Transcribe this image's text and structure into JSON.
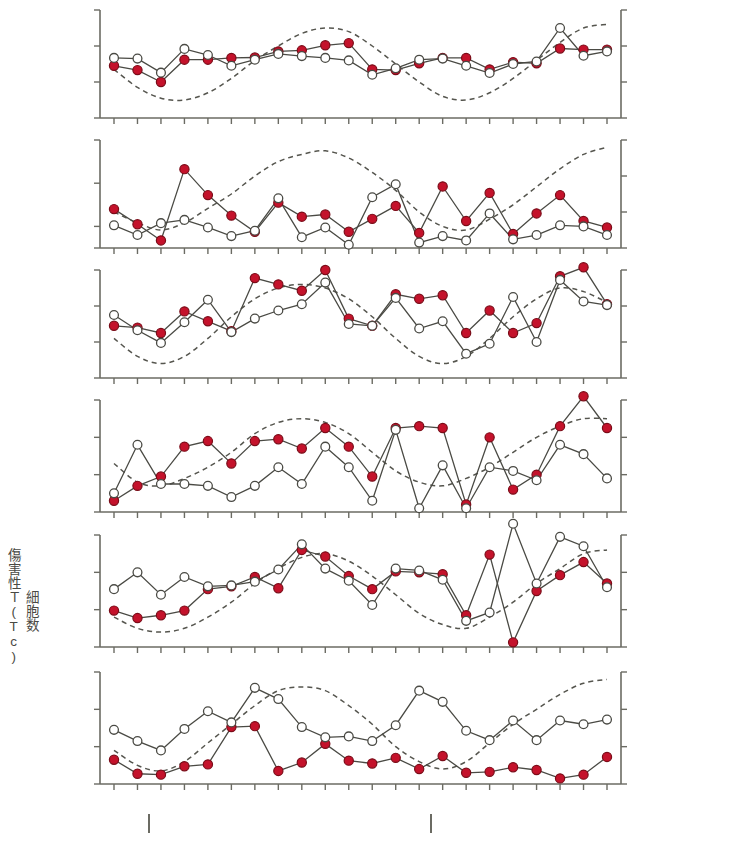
{
  "figure": {
    "right_axis_label": "気温",
    "degf_label": "°F",
    "right_ticks": [
      "90",
      "70",
      "50",
      "30"
    ],
    "x_months": [
      "11",
      "12",
      "1",
      "2",
      "3",
      "4",
      "5",
      "6",
      "7",
      "8",
      "9",
      "10",
      "11",
      "12",
      "1",
      "2",
      "3",
      "4",
      "5",
      "6",
      "7",
      "8"
    ],
    "years": [
      {
        "label": "1981",
        "center_index": 0.5
      },
      {
        "label": "1982",
        "center_index": 7.5
      },
      {
        "label": "1983",
        "center_index": 18.0
      }
    ],
    "year_separator_indices": [
      1.5,
      13.5
    ],
    "colors": {
      "marker_red": "#c4122b",
      "marker_open": "#ffffff",
      "line": "#4a4a44",
      "dashed": "#55554e",
      "axis": "#6b6b63"
    }
  },
  "chart_data": [
    {
      "type": "line",
      "panel": "a",
      "title": "リンパ球数",
      "unit": "(×10⁵/ mℓ)",
      "unit_exp": "6",
      "ylabel_ticks": [
        "3",
        "2",
        "1",
        "0"
      ],
      "ylim": [
        0,
        3
      ],
      "ytick_values": [
        3,
        2,
        1,
        0
      ],
      "right_ylim": [
        30,
        90
      ],
      "x": [
        "11",
        "12",
        "1",
        "2",
        "3",
        "4",
        "5",
        "6",
        "7",
        "8",
        "9",
        "10",
        "11",
        "12",
        "1",
        "2",
        "3",
        "4",
        "5",
        "6",
        "7",
        "8"
      ],
      "series": [
        {
          "name": "closed-red",
          "values": [
            1.45,
            1.33,
            1.0,
            1.62,
            1.62,
            1.67,
            1.68,
            1.85,
            1.88,
            2.02,
            2.08,
            1.35,
            1.33,
            1.52,
            1.67,
            1.67,
            1.35,
            1.55,
            1.52,
            1.93,
            1.9,
            1.9
          ]
        },
        {
          "name": "open-white",
          "values": [
            1.67,
            1.65,
            1.26,
            1.92,
            1.75,
            1.45,
            1.62,
            1.78,
            1.72,
            1.67,
            1.6,
            1.2,
            1.38,
            1.62,
            1.65,
            1.45,
            1.25,
            1.5,
            1.57,
            2.5,
            1.73,
            1.85
          ]
        }
      ],
      "dashed_curve": {
        "name": "temperature",
        "values_f": [
          57,
          47,
          41,
          40,
          44,
          52,
          62,
          70,
          77,
          80,
          78,
          70,
          60,
          50,
          42,
          40,
          44,
          52,
          62,
          72,
          80,
          82
        ]
      }
    },
    {
      "type": "line",
      "panel": "b",
      "title": "単球数",
      "unit": "(×10⁵/ mℓ)",
      "unit_exp": "5",
      "ylabel_ticks": [
        "6",
        "4",
        "2",
        "1"
      ],
      "ylim": [
        1,
        6
      ],
      "ytick_values": [
        6,
        4,
        2,
        1
      ],
      "right_ylim": [
        30,
        90
      ],
      "x": [
        "11",
        "12",
        "1",
        "2",
        "3",
        "4",
        "5",
        "6",
        "7",
        "8",
        "9",
        "10",
        "11",
        "12",
        "1",
        "2",
        "3",
        "4",
        "5",
        "6",
        "7",
        "8"
      ],
      "series": [
        {
          "name": "closed-red",
          "values": [
            2.8,
            2.1,
            1.35,
            4.65,
            3.45,
            2.5,
            1.75,
            3.1,
            2.45,
            2.55,
            1.75,
            2.35,
            2.95,
            1.7,
            3.85,
            2.25,
            3.55,
            1.65,
            2.6,
            3.45,
            2.25,
            1.95
          ]
        },
        {
          "name": "open-white",
          "values": [
            2.05,
            1.6,
            2.15,
            2.3,
            1.95,
            1.55,
            1.8,
            3.3,
            1.5,
            1.95,
            1.15,
            3.35,
            3.95,
            1.25,
            1.55,
            1.35,
            2.6,
            1.4,
            1.6,
            2.05,
            2.0,
            1.6
          ]
        }
      ],
      "dashed_curve": {
        "name": "temperature",
        "values_f": [
          50,
          44,
          40,
          44,
          52,
          60,
          70,
          78,
          82,
          84,
          80,
          72,
          62,
          50,
          42,
          40,
          46,
          54,
          64,
          74,
          82,
          86
        ]
      }
    },
    {
      "type": "line",
      "panel": "c",
      "title": "全Ｔ細胞数",
      "unit": "(×10⁵/ mℓ)",
      "unit_exp": "5",
      "ylabel_ticks": [
        "14",
        "10",
        "6",
        "2"
      ],
      "ylim": [
        2,
        14
      ],
      "ytick_values": [
        14,
        10,
        6,
        2
      ],
      "right_ylim": [
        30,
        90
      ],
      "x": [
        "11",
        "12",
        "1",
        "2",
        "3",
        "4",
        "5",
        "6",
        "7",
        "8",
        "9",
        "10",
        "11",
        "12",
        "1",
        "2",
        "3",
        "4",
        "5",
        "6",
        "7",
        "8"
      ],
      "series": [
        {
          "name": "closed-red",
          "values": [
            7.8,
            7.6,
            7.0,
            9.4,
            8.3,
            7.2,
            13.1,
            12.4,
            11.7,
            14.0,
            8.6,
            7.8,
            11.3,
            10.8,
            11.2,
            7.0,
            9.5,
            7.0,
            8.1,
            13.3,
            14.3,
            10.2
          ]
        },
        {
          "name": "open-white",
          "values": [
            9.0,
            7.3,
            5.9,
            8.2,
            10.7,
            7.1,
            8.6,
            9.5,
            10.2,
            12.6,
            8.0,
            7.8,
            10.9,
            7.5,
            8.3,
            4.7,
            5.8,
            11.0,
            6.0,
            12.9,
            10.5,
            10.1
          ]
        },
        {
          "name": "dashed-temp",
          "values": [
            6.0,
            4.4,
            3.8,
            4.6,
            6.4,
            8.6,
            10.5,
            11.6,
            11.8,
            11.5,
            10.2,
            8.2,
            6.2,
            4.6,
            4.0,
            4.6,
            6.4,
            8.6,
            10.4,
            11.5,
            11.0,
            10.0
          ]
        }
      ],
      "dashed_curve": {
        "name": "temperature",
        "values_f": [
          52,
          42,
          38,
          42,
          52,
          64,
          74,
          80,
          82,
          80,
          74,
          64,
          52,
          42,
          38,
          42,
          52,
          64,
          74,
          80,
          78,
          72
        ]
      }
    },
    {
      "type": "line",
      "panel": "d",
      "title": "ヘルパーＴ(Th)細胞数",
      "unit": "(×10⁵/ mℓ)",
      "unit_exp": "5",
      "ylabel_ticks": [
        "9",
        "7",
        "5",
        "3"
      ],
      "ylim": [
        3,
        9
      ],
      "ytick_values": [
        9,
        7,
        5,
        3
      ],
      "right_ylim": [
        30,
        90
      ],
      "x": [
        "11",
        "12",
        "1",
        "2",
        "3",
        "4",
        "5",
        "6",
        "7",
        "8",
        "9",
        "10",
        "11",
        "12",
        "1",
        "2",
        "3",
        "4",
        "5",
        "6",
        "7",
        "8"
      ],
      "series": [
        {
          "name": "closed-red",
          "values": [
            3.6,
            4.4,
            4.9,
            6.5,
            6.8,
            5.6,
            6.8,
            6.9,
            6.4,
            7.5,
            6.5,
            4.9,
            7.5,
            7.6,
            7.5,
            3.4,
            7.0,
            4.2,
            5.0,
            7.6,
            9.2,
            7.5
          ]
        },
        {
          "name": "open-white",
          "values": [
            4.0,
            6.6,
            4.5,
            4.5,
            4.4,
            3.8,
            4.4,
            5.4,
            4.5,
            6.5,
            5.4,
            3.6,
            7.4,
            3.2,
            5.5,
            3.2,
            5.4,
            5.2,
            4.7,
            6.6,
            6.1,
            4.8
          ]
        }
      ],
      "dashed_curve": {
        "name": "temperature",
        "values_f": [
          56,
          46,
          44,
          48,
          54,
          62,
          72,
          78,
          80,
          78,
          72,
          62,
          52,
          46,
          44,
          48,
          54,
          62,
          70,
          76,
          80,
          80
        ]
      }
    },
    {
      "type": "line",
      "panel": "e",
      "title": "傷害性Ｔ(Tc)\n細胞数",
      "unit": "(×10⁵/ mℓ)",
      "unit_exp": "5",
      "ylabel_ticks": [
        "7",
        "5",
        "3",
        "1"
      ],
      "ylim": [
        1,
        7
      ],
      "ytick_values": [
        7,
        5,
        3,
        1
      ],
      "right_ylim": [
        30,
        90
      ],
      "x": [
        "11",
        "12",
        "1",
        "2",
        "3",
        "4",
        "5",
        "6",
        "7",
        "8",
        "9",
        "10",
        "11",
        "12",
        "1",
        "2",
        "3",
        "4",
        "5",
        "6",
        "7",
        "8"
      ],
      "series": [
        {
          "name": "closed-red",
          "values": [
            2.95,
            2.55,
            2.7,
            2.95,
            4.1,
            4.25,
            4.75,
            4.15,
            6.2,
            5.85,
            4.8,
            4.1,
            5.05,
            5.0,
            4.9,
            2.7,
            5.95,
            1.25,
            4.0,
            4.85,
            5.55,
            4.4
          ]
        },
        {
          "name": "open-white",
          "values": [
            4.1,
            5.0,
            3.8,
            4.75,
            4.25,
            4.3,
            4.5,
            5.15,
            6.5,
            5.2,
            4.55,
            3.25,
            5.2,
            5.1,
            4.6,
            2.4,
            2.85,
            7.6,
            4.4,
            6.9,
            6.4,
            4.2
          ]
        }
      ],
      "dashed_curve": {
        "name": "temperature",
        "values_f": [
          46,
          40,
          38,
          40,
          46,
          54,
          64,
          72,
          78,
          80,
          76,
          68,
          58,
          48,
          42,
          40,
          46,
          54,
          64,
          72,
          80,
          82
        ]
      }
    },
    {
      "type": "line",
      "panel": "f",
      "title": "NK 細胞数",
      "unit": "(×10⁵/ mℓ)",
      "unit_exp": "5",
      "ylabel_ticks": [
        "6",
        "4",
        "2",
        "0"
      ],
      "ylim": [
        0,
        6
      ],
      "ytick_values": [
        6,
        4,
        2,
        0
      ],
      "right_ylim": [
        30,
        90
      ],
      "x": [
        "11",
        "12",
        "1",
        "2",
        "3",
        "4",
        "5",
        "6",
        "7",
        "8",
        "9",
        "10",
        "11",
        "12",
        "1",
        "2",
        "3",
        "4",
        "5",
        "6",
        "7",
        "8"
      ],
      "series": [
        {
          "name": "closed-red",
          "values": [
            1.3,
            0.55,
            0.5,
            0.95,
            1.05,
            3.05,
            3.1,
            0.7,
            1.15,
            2.15,
            1.25,
            1.1,
            1.4,
            0.8,
            1.5,
            0.6,
            0.65,
            0.9,
            0.75,
            0.3,
            0.5,
            1.45
          ]
        },
        {
          "name": "open-white",
          "values": [
            2.9,
            2.3,
            1.8,
            2.95,
            3.9,
            3.3,
            5.15,
            4.55,
            3.05,
            2.5,
            2.55,
            2.3,
            3.15,
            5.0,
            4.4,
            2.85,
            2.35,
            3.4,
            2.35,
            3.4,
            3.2,
            3.45
          ]
        }
      ],
      "dashed_curve": {
        "name": "temperature",
        "values_f": [
          48,
          40,
          37,
          42,
          52,
          62,
          72,
          80,
          82,
          80,
          72,
          62,
          50,
          42,
          38,
          42,
          52,
          62,
          70,
          78,
          84,
          86
        ]
      }
    }
  ]
}
